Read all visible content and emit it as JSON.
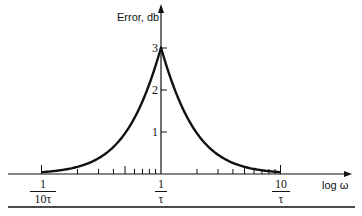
{
  "chart_data": {
    "type": "line",
    "title": "",
    "xlabel": "log ω",
    "ylabel": "Error, db",
    "x_scale": "log",
    "x_ticks": [
      {
        "value": 0.1,
        "label_num": "1",
        "label_den": "10τ"
      },
      {
        "value": 1,
        "label_num": "1",
        "label_den": "τ"
      },
      {
        "value": 10,
        "label_num": "10",
        "label_den": "τ"
      }
    ],
    "y_ticks": [
      1,
      2,
      3
    ],
    "ylim": [
      0,
      3.2
    ],
    "xlim_decades": [
      -1,
      1
    ],
    "grid": false,
    "legend": null,
    "series": [
      {
        "name": "Asymptote error",
        "x_omega_tau": [
          0.1,
          0.2,
          0.3,
          0.4,
          0.5,
          0.6,
          0.7,
          0.8,
          0.9,
          1.0,
          1.11,
          1.25,
          1.43,
          1.67,
          2.0,
          2.5,
          3.33,
          5.0,
          10.0
        ],
        "values": [
          0.04,
          0.17,
          0.37,
          0.64,
          0.97,
          1.34,
          1.73,
          2.15,
          2.58,
          3.01,
          2.58,
          2.15,
          1.73,
          1.34,
          0.97,
          0.64,
          0.37,
          0.17,
          0.04
        ]
      }
    ]
  },
  "axes": {
    "y_label": "Error, db",
    "x_label": "log ω",
    "y_tick_labels": [
      "1",
      "2",
      "3"
    ],
    "x_tick_labels": [
      {
        "num": "1",
        "den": "10τ"
      },
      {
        "num": "1",
        "den": "τ"
      },
      {
        "num": "10",
        "den": "τ"
      }
    ]
  },
  "colors": {
    "ink": "#111111",
    "background": "#ffffff"
  }
}
